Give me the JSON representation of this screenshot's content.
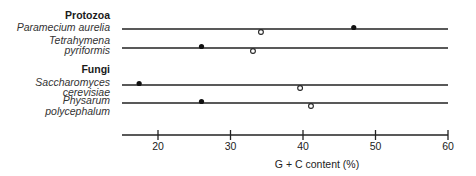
{
  "chart_data": {
    "type": "scatter",
    "title": "",
    "xlabel": "G + C content (%)",
    "ylabel": "",
    "xlim": [
      15,
      60
    ],
    "x_ticks": [
      20,
      30,
      40,
      50,
      60
    ],
    "grid": false,
    "legend": null,
    "marker_legend_note": "filled circle and open circle markers denote two distinct DNA fractions per organism",
    "groups": [
      {
        "name": "Protozoa",
        "organisms": [
          {
            "name_line1": "Paramecium aurelia",
            "name_line2": "",
            "filled": [
              47
            ],
            "open": [
              34.2
            ]
          },
          {
            "name_line1": "Tetrahymena",
            "name_line2": "pyriformis",
            "filled": [
              26
            ],
            "open": [
              33.1
            ]
          }
        ]
      },
      {
        "name": "Fungi",
        "organisms": [
          {
            "name_line1": "Saccharomyces",
            "name_line2": "cerevisiae",
            "filled": [
              17.4
            ],
            "open": [
              39.6
            ]
          },
          {
            "name_line1": "Physarum",
            "name_line2": "polycephalum",
            "filled": [
              26
            ],
            "open": [
              41.1
            ]
          }
        ]
      }
    ]
  },
  "labels": {
    "protozoa": "Protozoa",
    "paramecium": "Paramecium aurelia",
    "tetra1": "Tetrahymena",
    "tetra2": "pyriformis",
    "fungi": "Fungi",
    "sacch1": "Saccharomyces",
    "sacch2": "cerevisiae",
    "phys1": "Physarum",
    "phys2": "polycephalum"
  },
  "axis": {
    "title": "G + C content (%)",
    "ticks": [
      "20",
      "30",
      "40",
      "50",
      "60"
    ]
  }
}
